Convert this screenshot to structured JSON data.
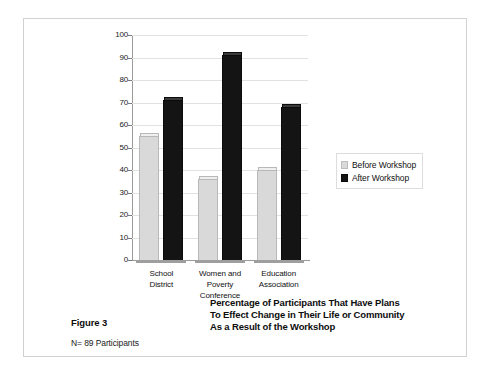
{
  "figure": {
    "number_label": "Figure 3",
    "sample_size_label": "N= 89 Participants",
    "caption_line1": "Percentage of Participants That Have Plans",
    "caption_line2": "To Effect Change in Their Life or Community",
    "caption_line3": "As a Result of the Workshop"
  },
  "legend": {
    "items": [
      {
        "label": "Before Workshop",
        "color": "#d9d9d9",
        "swatch": "before-workshop-swatch"
      },
      {
        "label": "After Workshop",
        "color": "#141414",
        "swatch": "after-workshop-swatch"
      }
    ]
  },
  "axis": {
    "y_ticks": [
      "0",
      "10",
      "20",
      "30",
      "40",
      "50",
      "60",
      "70",
      "80",
      "90",
      "100"
    ]
  },
  "categories_display": [
    {
      "line1": "School",
      "line2": "District",
      "line3": ""
    },
    {
      "line1": "Women and",
      "line2": "Poverty",
      "line3": "Conference"
    },
    {
      "line1": "Education",
      "line2": "Association",
      "line3": ""
    }
  ],
  "chart_data": {
    "type": "bar",
    "title": "Percentage of Participants That Have Plans To Effect Change in Their Life or Community As a Result of the Workshop",
    "subtitle": "N= 89 Participants",
    "categories": [
      "School District",
      "Women and Poverty Conference",
      "Education Association"
    ],
    "series": [
      {
        "name": "Before Workshop",
        "values": [
          55,
          36,
          40
        ],
        "color": "#d9d9d9"
      },
      {
        "name": "After Workshop",
        "values": [
          71,
          91,
          68
        ],
        "color": "#141414"
      }
    ],
    "xlabel": "",
    "ylabel": "",
    "ylim": [
      0,
      100
    ],
    "ytick_step": 10,
    "grid": true,
    "legend_position": "right"
  }
}
